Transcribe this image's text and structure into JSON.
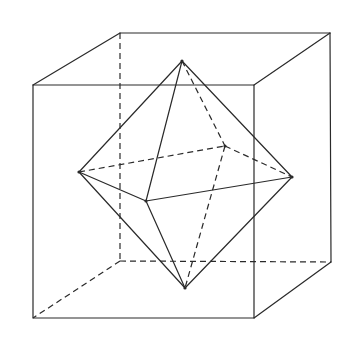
{
  "diagram": {
    "title": "",
    "colors": {
      "stroke": "#2a2a2a",
      "background": "#ffffff"
    },
    "cube": {
      "front_top_left": [
        33,
        85
      ],
      "front_top_right": [
        254,
        85
      ],
      "front_bottom_left": [
        33,
        318
      ],
      "front_bottom_right": [
        254,
        318
      ],
      "back_top_left": [
        120,
        33
      ],
      "back_top_right": [
        330,
        33
      ],
      "back_bottom_left": [
        120,
        261
      ],
      "back_bottom_right": [
        331,
        262
      ]
    },
    "octahedron": {
      "top": [
        182,
        61
      ],
      "bottom": [
        185,
        288
      ],
      "left": [
        79,
        172
      ],
      "right": [
        292,
        177
      ],
      "front": [
        146,
        201
      ],
      "back": [
        225,
        146
      ]
    }
  }
}
